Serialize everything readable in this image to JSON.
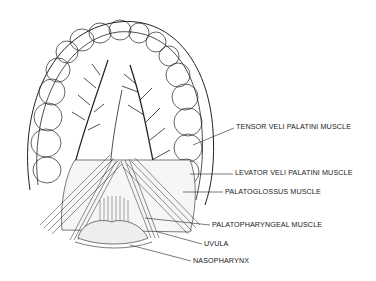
{
  "figure": {
    "labels": [
      {
        "text": "TENSOR VELI PALATINI MUSCLE",
        "x": 236,
        "y": 126
      },
      {
        "text": "LEVATOR VELI PALATINI MUSCLE",
        "x": 235,
        "y": 172
      },
      {
        "text": "PALATOGLOSSUS MUSCLE",
        "x": 225,
        "y": 190
      },
      {
        "text": "PALATOPHARYNGEAL MUSCLE",
        "x": 212,
        "y": 223
      },
      {
        "text": "UVULA",
        "x": 204,
        "y": 242
      },
      {
        "text": "NASOPHARYNX",
        "x": 193,
        "y": 259
      }
    ]
  }
}
